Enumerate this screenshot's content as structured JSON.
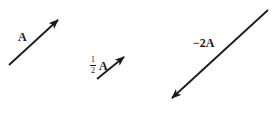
{
  "diagram": {
    "type": "vector-scaling",
    "colors": {
      "ink": "#1a1a1a",
      "background": "#ffffff"
    },
    "vectors": [
      {
        "id": "A",
        "label": "A",
        "tail": [
          9,
          65
        ],
        "head": [
          58,
          20
        ]
      },
      {
        "id": "half-A",
        "label_num": "1",
        "label_den": "2",
        "label_sym": "A",
        "tail": [
          97,
          79
        ],
        "head": [
          124,
          57
        ]
      },
      {
        "id": "neg-2A",
        "label": "−2A",
        "tail": [
          268,
          10
        ],
        "head": [
          172,
          98
        ]
      }
    ]
  }
}
